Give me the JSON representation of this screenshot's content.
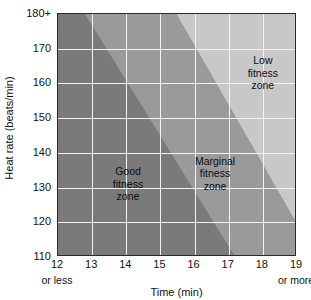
{
  "chart_data": {
    "type": "area",
    "title": "",
    "xlabel": "Time (min)",
    "ylabel": "Heat rate (beats/min)",
    "xlim": [
      12,
      19
    ],
    "ylim": [
      110,
      180
    ],
    "grid": true,
    "legend_position": "inline-annotations",
    "x_ticks": [
      {
        "value": 12,
        "label": "12"
      },
      {
        "value": 13,
        "label": "13"
      },
      {
        "value": 14,
        "label": "14"
      },
      {
        "value": 15,
        "label": "15"
      },
      {
        "value": 16,
        "label": "16"
      },
      {
        "value": 17,
        "label": "17"
      },
      {
        "value": 18,
        "label": "18"
      },
      {
        "value": 19,
        "label": "19"
      }
    ],
    "y_ticks": [
      {
        "value": 180,
        "label": "180+"
      },
      {
        "value": 170,
        "label": "170"
      },
      {
        "value": 160,
        "label": "160"
      },
      {
        "value": 150,
        "label": "150"
      },
      {
        "value": 140,
        "label": "140"
      },
      {
        "value": 130,
        "label": "130"
      },
      {
        "value": 120,
        "label": "120"
      },
      {
        "value": 110,
        "label": "110"
      }
    ],
    "x_axis_endnotes": {
      "left": "or less",
      "right": "or more"
    },
    "zones": [
      {
        "name": "good-fitness-zone",
        "label_lines": [
          "Good",
          "fitness",
          "zone"
        ],
        "color": "#7a7a7a",
        "label_x": 14.05,
        "label_y": 131,
        "boundary_description": "Left of the line running from (12.8, 180) to (17.2, 110)",
        "boundary_points": [
          [
            12.8,
            180
          ],
          [
            17.2,
            110
          ]
        ]
      },
      {
        "name": "marginal-fitness-zone",
        "label_lines": [
          "Marginal",
          "fitness",
          "zone"
        ],
        "color": "#9a9a9a",
        "label_x": 16.6,
        "label_y": 134,
        "boundary_description": "Band between the line (12.8,180)-(17.2,110) and the line (15.5,180)-(19,120)",
        "boundary_points": [
          [
            15.5,
            180
          ],
          [
            19.0,
            120
          ]
        ]
      },
      {
        "name": "low-fitness-zone",
        "label_lines": [
          "Low",
          "fitness",
          "zone"
        ],
        "color": "#c8c8c8",
        "label_x": 18.0,
        "label_y": 163,
        "boundary_description": "Right of the line running from (15.5, 180) to (19, 120)",
        "boundary_points": [
          [
            15.5,
            180
          ],
          [
            19.0,
            120
          ]
        ]
      }
    ]
  }
}
